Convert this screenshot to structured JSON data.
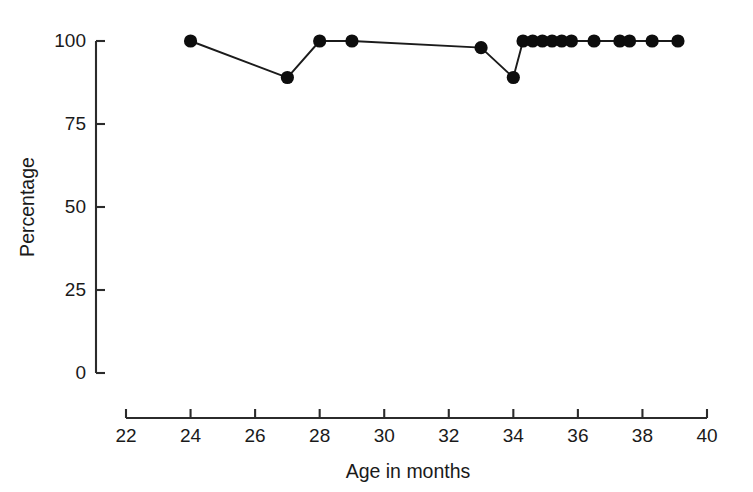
{
  "chart_data": {
    "type": "line",
    "title": "",
    "subtitle": "",
    "xlabel": "Age in months",
    "ylabel": "Percentage",
    "xlim": [
      22,
      40
    ],
    "ylim": [
      0,
      100
    ],
    "grid": false,
    "legend": "none",
    "xticks": [
      22,
      24,
      26,
      28,
      30,
      32,
      34,
      36,
      38,
      40
    ],
    "xticklabels": [
      "22",
      "24",
      "26",
      "28",
      "30",
      "32",
      "34",
      "36",
      "38",
      "40"
    ],
    "yticks": [
      0,
      25,
      50,
      75,
      100
    ],
    "yticklabels": [
      "0",
      "25",
      "50",
      "75",
      "100"
    ],
    "marker": "filled-circle",
    "series": [
      {
        "name": "Percentage",
        "x": [
          24.0,
          27.0,
          28.0,
          29.0,
          33.0,
          34.0,
          34.3,
          34.6,
          34.9,
          35.2,
          35.5,
          35.8,
          36.5,
          37.3,
          37.6,
          38.3,
          39.1
        ],
        "y": [
          100,
          89,
          100,
          100,
          98,
          89,
          100,
          100,
          100,
          100,
          100,
          100,
          100,
          100,
          100,
          100,
          100
        ]
      }
    ]
  },
  "axes": {
    "x_axis_name": "age-axis",
    "y_axis_name": "percentage-axis"
  }
}
